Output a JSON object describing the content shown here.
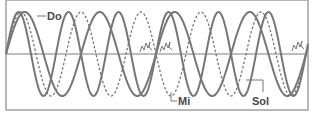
{
  "diagram": {
    "type": "waveform-comparison",
    "frame": {
      "x": 6,
      "y": 0,
      "width": 302,
      "height": 110
    },
    "axis_y": 54,
    "amplitude": 42,
    "start_x": 6,
    "colors": {
      "wave": "#777777",
      "frame": "#a0a0a0",
      "axis": "#a8a8a8",
      "label": "#4a4a4a",
      "leader": "#777777"
    },
    "waves": [
      {
        "name": "Do",
        "style": "solid",
        "period": 75,
        "relative_frequency": 4
      },
      {
        "name": "Mi",
        "style": "dashed",
        "period": 60,
        "relative_frequency": 5
      },
      {
        "name": "Sol",
        "style": "solid",
        "period": 50,
        "relative_frequency": 6
      }
    ],
    "labels": [
      {
        "text": "Do",
        "x": 47,
        "y": 20,
        "leader": [
          [
            37,
            16
          ],
          [
            46,
            16
          ]
        ]
      },
      {
        "text": "Mi",
        "x": 178,
        "y": 105,
        "leader": [
          [
            171,
            92
          ],
          [
            171,
            101
          ],
          [
            177,
            101
          ]
        ]
      },
      {
        "text": "Sol",
        "x": 252,
        "y": 105,
        "leader": [
          [
            246,
            80
          ],
          [
            263,
            80
          ],
          [
            263,
            92
          ]
        ]
      }
    ],
    "noise_marks": [
      {
        "x": 140,
        "y": 42
      },
      {
        "x": 160,
        "y": 42
      },
      {
        "x": 292,
        "y": 41
      }
    ]
  }
}
